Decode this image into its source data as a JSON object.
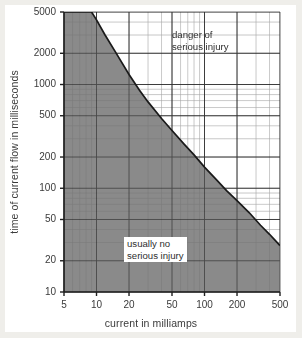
{
  "figure": {
    "background": "#ffffff",
    "page_band_color": "#efeeea"
  },
  "chart_data": {
    "type": "line",
    "title": "",
    "subtitle": "",
    "xlabel": "current in milliamps",
    "ylabel": "time of current flow in milliseconds",
    "xscale": "log",
    "yscale": "log",
    "xlim": [
      5,
      500
    ],
    "ylim": [
      10,
      5000
    ],
    "grid": true,
    "grid_minor": true,
    "legend_position": "none",
    "xticks": [
      5,
      10,
      20,
      50,
      100,
      200,
      500
    ],
    "xticklabels": [
      "5",
      "10",
      "20",
      "50",
      "100",
      "200",
      "500"
    ],
    "yticks": [
      10,
      20,
      50,
      100,
      200,
      500,
      1000,
      2000,
      5000
    ],
    "yticklabels": [
      "10",
      "20",
      "50",
      "100",
      "200",
      "500",
      "1000",
      "2000",
      "5000"
    ],
    "series": [
      {
        "name": "injury threshold curve",
        "x": [
          5,
          7,
          9,
          10,
          12,
          15,
          20,
          25,
          30,
          40,
          50,
          65,
          80,
          100,
          130,
          160,
          200,
          260,
          330,
          400,
          500
        ],
        "y": [
          5000,
          5000,
          5000,
          4200,
          3000,
          2050,
          1250,
          880,
          680,
          470,
          360,
          265,
          210,
          160,
          120,
          95,
          76,
          58,
          44,
          36,
          28
        ]
      }
    ],
    "shaded_region": {
      "label": "usually no serious injury",
      "fill": "#8a8a8a",
      "below_curve": true
    },
    "unshaded_region": {
      "label": "danger of serious injury",
      "fill": "#ffffff",
      "above_curve": true
    },
    "annotations": [
      {
        "name": "danger-annotation",
        "text": "danger of\nserious injury",
        "x_px": 172,
        "y_px": 29,
        "boxed": false
      },
      {
        "name": "usually-no-injury-annotation",
        "text": "usually no\nserious injury",
        "x_px": 124,
        "y_px": 237,
        "boxed": true
      }
    ],
    "colors": {
      "curve": "#1a1a1a",
      "shade": "#8a8a8a",
      "grid_major": "#5a5a5a",
      "grid_minor": "#b9b9b9",
      "axis": "#1f1f1f",
      "text": "#333333"
    }
  }
}
